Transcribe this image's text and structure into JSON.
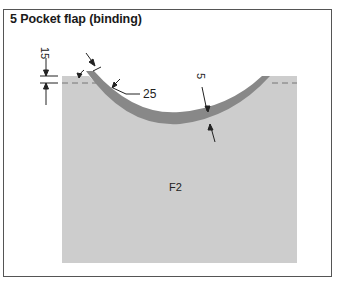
{
  "figure": {
    "title": "5 Pocket flap (binding)",
    "piece_label": "F2",
    "dimensions": {
      "seam_allowance": "15",
      "binding_width": "25",
      "binding_thickness": "5"
    },
    "colors": {
      "fabric": "#cdcdcd",
      "binding": "#888888",
      "line": "#222222",
      "frame": "#555555"
    }
  }
}
